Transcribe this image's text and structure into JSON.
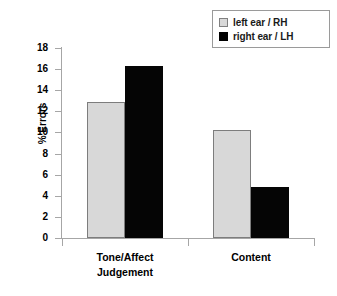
{
  "chart_data": {
    "type": "bar",
    "title": "",
    "subtitle": "",
    "xlabel": "",
    "ylabel": "% Errors",
    "categories": [
      "Tone/Affect\nJudgement",
      "Content"
    ],
    "category_labels_flat": [
      "Tone/Affect Judgement",
      "Content"
    ],
    "series": [
      {
        "name": "left ear / RH",
        "color": "#d8d8d8",
        "values": [
          12.9,
          10.2
        ]
      },
      {
        "name": "right ear / LH",
        "color": "#000000",
        "values": [
          16.3,
          4.8
        ]
      }
    ],
    "ylim": [
      0,
      18
    ],
    "ytick_step": 2,
    "yticks": [
      "0",
      "2",
      "4",
      "6",
      "8",
      "10",
      "12",
      "14",
      "16",
      "18"
    ],
    "ytick_values": [
      0,
      2,
      4,
      6,
      8,
      10,
      12,
      14,
      16,
      18
    ],
    "grid": false,
    "legend_position": "top-right",
    "legend_border_color": "#9a9a9a",
    "axis_color": "#a6a6a6",
    "background": "#ffffff"
  },
  "legend": {
    "items": [
      {
        "label": "left ear / RH",
        "swatch": "legend-swatch-light"
      },
      {
        "label": "right ear / LH",
        "swatch": "legend-swatch-dark"
      }
    ]
  },
  "axes": {
    "y_title": "% Errors"
  }
}
